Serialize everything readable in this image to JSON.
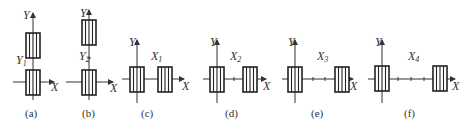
{
  "figure": {
    "panels": [
      {
        "id": "a",
        "caption": "(a)",
        "axis_x": "X",
        "axis_y": "Y",
        "offset_label": "Y",
        "offset_sub": "1",
        "layout": "vertical"
      },
      {
        "id": "b",
        "caption": "(b)",
        "axis_x": "X",
        "axis_y": "Y",
        "offset_label": "Y",
        "offset_sub": "2",
        "layout": "vertical"
      },
      {
        "id": "c",
        "caption": "(c)",
        "axis_x": "X",
        "axis_y": "Y",
        "offset_label": "X",
        "offset_sub": "1",
        "layout": "horizontal"
      },
      {
        "id": "d",
        "caption": "(d)",
        "axis_x": "X",
        "axis_y": "Y",
        "offset_label": "X",
        "offset_sub": "2",
        "layout": "horizontal"
      },
      {
        "id": "e",
        "caption": "(e)",
        "axis_x": "X",
        "axis_y": "Y",
        "offset_label": "X",
        "offset_sub": "3",
        "layout": "horizontal"
      },
      {
        "id": "f",
        "caption": "(f)",
        "axis_x": "X",
        "axis_y": "Y",
        "offset_label": "X",
        "offset_sub": "4",
        "layout": "horizontal"
      }
    ]
  }
}
